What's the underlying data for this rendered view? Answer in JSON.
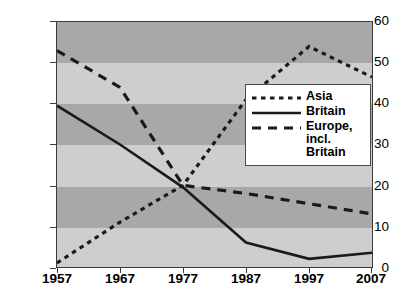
{
  "chart_data": {
    "type": "line",
    "title": "",
    "xlabel": "",
    "ylabel": "",
    "x": [
      1957,
      1967,
      1977,
      1987,
      1997,
      2007
    ],
    "xtick_labels": [
      "1957",
      "1967",
      "1977",
      "1987",
      "1997",
      "2007"
    ],
    "ytick_labels": [
      "0",
      "10",
      "20",
      "30",
      "40",
      "50",
      "60"
    ],
    "yticks": [
      0,
      10,
      20,
      30,
      40,
      50,
      60
    ],
    "ylim": [
      0,
      60
    ],
    "xlim": [
      1957,
      2007
    ],
    "grid": false,
    "banded_background": true,
    "legend_position": "center-right",
    "series": [
      {
        "name": "Asia",
        "style": "dotted",
        "color": "#1a1a1a",
        "values": [
          1,
          11,
          20,
          41,
          54,
          46.5
        ]
      },
      {
        "name": "Britain",
        "style": "solid",
        "color": "#1a1a1a",
        "values": [
          39.5,
          30,
          19.5,
          6,
          2,
          3.5
        ]
      },
      {
        "name": "Europe, incl. Britain",
        "style": "dashed",
        "color": "#1a1a1a",
        "values": [
          53,
          44,
          20,
          18,
          15.5,
          13
        ]
      }
    ]
  },
  "legend": {
    "entries": [
      {
        "label": "Asia",
        "label2": ""
      },
      {
        "label": "Britain",
        "label2": ""
      },
      {
        "label": "Europe,",
        "label2": "incl. Britain"
      }
    ]
  },
  "colors": {
    "band_dark": "#a8a8a8",
    "band_light": "#cecece",
    "line": "#1a1a1a",
    "frame": "#3b3b3b",
    "legend_bg": "#ffffff"
  }
}
